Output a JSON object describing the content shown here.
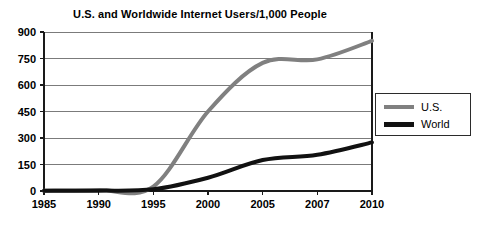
{
  "chart_data": {
    "type": "line",
    "title": "U.S. and Worldwide Internet Users/1,000 People",
    "xlabel": "",
    "ylabel": "",
    "x": [
      1985,
      1990,
      1995,
      2000,
      2005,
      2007,
      2010
    ],
    "xtick_labels": [
      "1985",
      "1990",
      "1995",
      "2000",
      "2005",
      "2007",
      "2010"
    ],
    "ytick_labels": [
      "0",
      "150",
      "300",
      "450",
      "600",
      "750",
      "900"
    ],
    "yticks": [
      0,
      150,
      300,
      450,
      600,
      750,
      900
    ],
    "ylim": [
      0,
      900
    ],
    "grid": true,
    "legend_position": "right",
    "series": [
      {
        "name": "U.S.",
        "color": "#808080",
        "width": 4,
        "values": [
          2,
          5,
          25,
          450,
          725,
          745,
          850
        ]
      },
      {
        "name": "World",
        "color": "#111111",
        "width": 4,
        "values": [
          1,
          2,
          10,
          75,
          175,
          205,
          275
        ]
      }
    ]
  },
  "legend": {
    "items": [
      {
        "label": "U.S."
      },
      {
        "label": "World"
      }
    ]
  }
}
